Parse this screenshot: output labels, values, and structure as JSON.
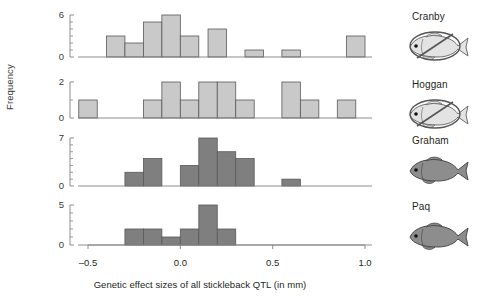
{
  "figure": {
    "xlabel": "Genetic effect sizes of all stickleback QTL (in mm)",
    "ylabel": "Frequency",
    "xticks": [
      "–0.5",
      "0.0",
      "0.5",
      "1.0"
    ],
    "xtick_values": [
      -0.5,
      0.0,
      0.5,
      1.0
    ],
    "colors": {
      "bar_light": "#c9c9c9",
      "bar_dark": "#7f7f7f",
      "bar_edge": "#58595b",
      "axis": "#808285",
      "text": "#231f20"
    }
  },
  "chart_data": [
    {
      "type": "bar",
      "title": "Cranby",
      "xlabel": "Genetic effect sizes of all stickleback QTL (in mm)",
      "ylabel": "Frequency",
      "xlim": [
        -0.6,
        1.1
      ],
      "ylim": [
        0,
        6
      ],
      "yticks": [
        0,
        6
      ],
      "bin_width": 0.1,
      "grid": false,
      "bin_starts": [
        -0.4,
        -0.3,
        -0.2,
        -0.1,
        0.0,
        0.1,
        0.3,
        0.5,
        0.7,
        0.9
      ],
      "values": [
        3,
        2,
        5,
        6,
        3,
        4,
        1,
        1,
        0,
        3
      ],
      "bars": [
        {
          "x0": -0.4,
          "x1": -0.3,
          "height": 3
        },
        {
          "x0": -0.3,
          "x1": -0.2,
          "height": 2
        },
        {
          "x0": -0.2,
          "x1": -0.1,
          "height": 5
        },
        {
          "x0": -0.1,
          "x1": 0.0,
          "height": 6
        },
        {
          "x0": 0.0,
          "x1": 0.1,
          "height": 3
        },
        {
          "x0": 0.15,
          "x1": 0.25,
          "height": 4
        },
        {
          "x0": 0.35,
          "x1": 0.45,
          "height": 1
        },
        {
          "x0": 0.55,
          "x1": 0.65,
          "height": 1
        },
        {
          "x0": 0.9,
          "x1": 1.0,
          "height": 3
        }
      ]
    },
    {
      "type": "bar",
      "title": "Hoggan",
      "xlabel": "Genetic effect sizes of all stickleback QTL (in mm)",
      "ylabel": "Frequency",
      "xlim": [
        -0.6,
        1.1
      ],
      "ylim": [
        0,
        2
      ],
      "yticks": [
        0,
        2
      ],
      "bin_width": 0.1,
      "grid": false,
      "bin_starts": [
        -0.55,
        -0.2,
        -0.1,
        0.0,
        0.1,
        0.2,
        0.3,
        0.55,
        0.65,
        0.85
      ],
      "values": [
        1,
        1,
        2,
        1,
        2,
        2,
        1,
        2,
        1,
        1
      ],
      "bars": [
        {
          "x0": -0.55,
          "x1": -0.45,
          "height": 1
        },
        {
          "x0": -0.2,
          "x1": -0.1,
          "height": 1
        },
        {
          "x0": -0.1,
          "x1": 0.0,
          "height": 2
        },
        {
          "x0": 0.0,
          "x1": 0.1,
          "height": 1
        },
        {
          "x0": 0.1,
          "x1": 0.2,
          "height": 2
        },
        {
          "x0": 0.2,
          "x1": 0.3,
          "height": 2
        },
        {
          "x0": 0.3,
          "x1": 0.4,
          "height": 1
        },
        {
          "x0": 0.55,
          "x1": 0.65,
          "height": 2
        },
        {
          "x0": 0.65,
          "x1": 0.75,
          "height": 1
        },
        {
          "x0": 0.85,
          "x1": 0.95,
          "height": 1
        }
      ]
    },
    {
      "type": "bar",
      "title": "Graham",
      "xlabel": "Genetic effect sizes of all stickleback QTL (in mm)",
      "ylabel": "Frequency",
      "xlim": [
        -0.6,
        1.1
      ],
      "ylim": [
        0,
        7
      ],
      "yticks": [
        0,
        7
      ],
      "bin_width": 0.1,
      "grid": false,
      "bin_starts": [
        -0.3,
        -0.2,
        0.0,
        0.1,
        0.2,
        0.3,
        0.55
      ],
      "values": [
        2,
        4,
        3,
        7,
        5,
        4,
        1
      ],
      "bars": [
        {
          "x0": -0.3,
          "x1": -0.2,
          "height": 2
        },
        {
          "x0": -0.2,
          "x1": -0.1,
          "height": 4
        },
        {
          "x0": 0.0,
          "x1": 0.1,
          "height": 3
        },
        {
          "x0": 0.1,
          "x1": 0.2,
          "height": 7
        },
        {
          "x0": 0.2,
          "x1": 0.3,
          "height": 5
        },
        {
          "x0": 0.3,
          "x1": 0.4,
          "height": 4
        },
        {
          "x0": 0.55,
          "x1": 0.65,
          "height": 1
        }
      ]
    },
    {
      "type": "bar",
      "title": "Paq",
      "xlabel": "Genetic effect sizes of all stickleback QTL (in mm)",
      "ylabel": "Frequency",
      "xlim": [
        -0.6,
        1.1
      ],
      "ylim": [
        0,
        5
      ],
      "yticks": [
        0,
        5
      ],
      "bin_width": 0.1,
      "grid": false,
      "bin_starts": [
        -0.3,
        -0.2,
        -0.1,
        0.0,
        0.1,
        0.2
      ],
      "values": [
        2,
        2,
        1,
        2,
        5,
        2
      ],
      "bars": [
        {
          "x0": -0.3,
          "x1": -0.2,
          "height": 2
        },
        {
          "x0": -0.2,
          "x1": -0.1,
          "height": 2
        },
        {
          "x0": -0.1,
          "x1": 0.0,
          "height": 1
        },
        {
          "x0": 0.0,
          "x1": 0.1,
          "height": 2
        },
        {
          "x0": 0.1,
          "x1": 0.2,
          "height": 5
        },
        {
          "x0": 0.2,
          "x1": 0.3,
          "height": 2
        }
      ]
    }
  ],
  "panels": [
    {
      "label": "Cranby",
      "icon": "fish-crossed-out-icon",
      "shade": "light",
      "crossed": true
    },
    {
      "label": "Hoggan",
      "icon": "fish-crossed-out-icon",
      "shade": "light",
      "crossed": true
    },
    {
      "label": "Graham",
      "icon": "fish-icon",
      "shade": "dark",
      "crossed": false
    },
    {
      "label": "Paq",
      "icon": "fish-icon",
      "shade": "dark",
      "crossed": false
    }
  ]
}
